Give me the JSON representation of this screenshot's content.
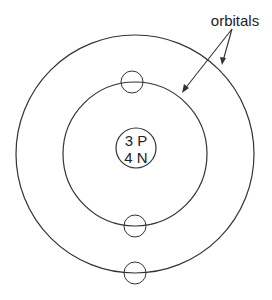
{
  "diagram": {
    "type": "atom-model",
    "nucleus": {
      "line1": "3 P",
      "line2": "4 N",
      "center": [
        136,
        148
      ],
      "radius": 20
    },
    "center": [
      135,
      154
    ],
    "orbits": [
      {
        "name": "inner",
        "radius": 72,
        "electrons": 2
      },
      {
        "name": "outer",
        "radius": 119,
        "electrons": 1
      }
    ],
    "electrons": [
      {
        "orbit": "inner",
        "cx": 132,
        "cy": 82,
        "r": 11
      },
      {
        "orbit": "inner",
        "cx": 135,
        "cy": 226,
        "r": 11
      },
      {
        "orbit": "outer",
        "cx": 135,
        "cy": 273,
        "r": 11
      }
    ],
    "annotation": {
      "label": "orbitals",
      "arrows": 2
    },
    "colors": {
      "stroke": "#333333",
      "text": "#222222",
      "background": "#ffffff"
    }
  }
}
